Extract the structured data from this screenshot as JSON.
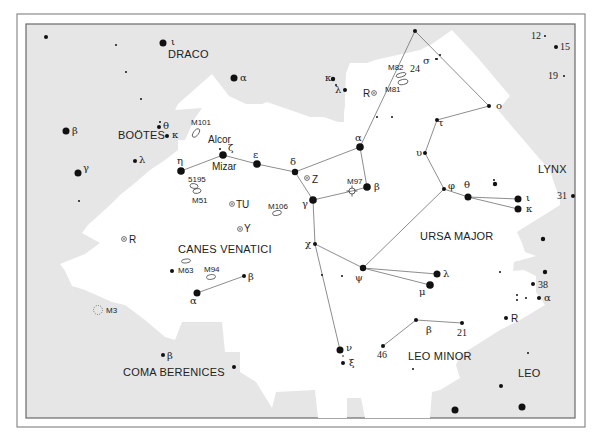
{
  "chart_data": {
    "type": "star-map",
    "title": "",
    "constellations": [
      {
        "name": "DRACO",
        "x": 168,
        "y": 58
      },
      {
        "name": "BOÖTES",
        "x": 118,
        "y": 139
      },
      {
        "name": "CANES VENATICI",
        "x": 178,
        "y": 253
      },
      {
        "name": "COMA BERENICES",
        "x": 123,
        "y": 376
      },
      {
        "name": "URSA MAJOR",
        "x": 420,
        "y": 240
      },
      {
        "name": "LEO MINOR",
        "x": 408,
        "y": 360
      },
      {
        "name": "LYNX",
        "x": 538,
        "y": 173
      },
      {
        "name": "LEO",
        "x": 518,
        "y": 377
      }
    ],
    "star_names": [
      {
        "name": "Alcor",
        "x": 208,
        "y": 143
      },
      {
        "name": "Mizar",
        "x": 212,
        "y": 170
      }
    ],
    "stars": [
      {
        "x": 46,
        "y": 37,
        "r": 2
      },
      {
        "x": 116,
        "y": 45,
        "r": 1
      },
      {
        "x": 163,
        "y": 43,
        "r": 3.5,
        "label": "ι",
        "lx": 171,
        "ly": 45
      },
      {
        "x": 126,
        "y": 72,
        "r": 1
      },
      {
        "x": 141,
        "y": 99,
        "r": 1
      },
      {
        "x": 234,
        "y": 78,
        "r": 3.5,
        "label": "α",
        "lx": 240,
        "ly": 81
      },
      {
        "x": 333,
        "y": 79,
        "r": 2.2,
        "label": "κ",
        "lx": 325,
        "ly": 81
      },
      {
        "x": 336,
        "y": 85,
        "r": 1
      },
      {
        "x": 345,
        "y": 90,
        "r": 2,
        "label": "λ",
        "lx": 335,
        "ly": 93
      },
      {
        "x": 66,
        "y": 131,
        "r": 3.5,
        "label": "β",
        "lx": 72,
        "ly": 134
      },
      {
        "x": 159,
        "y": 127,
        "r": 2,
        "label": "θ",
        "lx": 163,
        "ly": 129
      },
      {
        "x": 160,
        "y": 122,
        "r": 1
      },
      {
        "x": 167,
        "y": 136,
        "r": 2,
        "label": "κ",
        "lx": 172,
        "ly": 138
      },
      {
        "x": 78,
        "y": 173,
        "r": 3.5,
        "label": "γ",
        "lx": 83,
        "ly": 171
      },
      {
        "x": 135,
        "y": 161,
        "r": 2,
        "label": "λ",
        "lx": 139,
        "ly": 163
      },
      {
        "x": 79,
        "y": 201,
        "r": 1
      },
      {
        "x": 181,
        "y": 171,
        "r": 3.8,
        "label": "η",
        "lx": 177,
        "ly": 164
      },
      {
        "x": 223,
        "y": 155,
        "r": 3.8,
        "label": "ζ",
        "lx": 228,
        "ly": 151
      },
      {
        "x": 220,
        "y": 149,
        "r": 1
      },
      {
        "x": 257,
        "y": 164,
        "r": 3.8,
        "label": "ε",
        "lx": 253,
        "ly": 158
      },
      {
        "x": 295,
        "y": 172,
        "r": 3.2,
        "label": "δ",
        "lx": 290,
        "ly": 165
      },
      {
        "x": 313,
        "y": 200,
        "r": 3.8,
        "label": "γ",
        "lx": 302,
        "ly": 207
      },
      {
        "x": 360,
        "y": 147,
        "r": 3.8,
        "label": "α",
        "lx": 355,
        "ly": 141
      },
      {
        "x": 367,
        "y": 187,
        "r": 3.8,
        "label": "β",
        "lx": 374,
        "ly": 190
      },
      {
        "x": 315,
        "y": 244,
        "r": 2,
        "label": "χ",
        "lx": 305,
        "ly": 247
      },
      {
        "x": 363,
        "y": 268,
        "r": 3.2,
        "label": "ψ",
        "lx": 355,
        "ly": 281
      },
      {
        "x": 437,
        "y": 274,
        "r": 3.5,
        "label": "λ",
        "lx": 443,
        "ly": 277
      },
      {
        "x": 430,
        "y": 285,
        "r": 3.8,
        "label": "μ",
        "lx": 419,
        "ly": 295
      },
      {
        "x": 322,
        "y": 275,
        "r": 1
      },
      {
        "x": 342,
        "y": 276,
        "r": 1
      },
      {
        "x": 340,
        "y": 350,
        "r": 3.5,
        "label": "ν",
        "lx": 346,
        "ly": 351
      },
      {
        "x": 343,
        "y": 363,
        "r": 2,
        "label": "ξ",
        "lx": 349,
        "ly": 366
      },
      {
        "x": 343,
        "y": 356,
        "r": 0.8
      },
      {
        "x": 416,
        "y": 320,
        "r": 2,
        "label": "β",
        "lx": 426,
        "ly": 333
      },
      {
        "x": 462,
        "y": 323,
        "r": 2,
        "label": "21",
        "lx": 457,
        "ly": 336,
        "numeric": true
      },
      {
        "x": 383,
        "y": 346,
        "r": 2,
        "label": "46",
        "lx": 377,
        "ly": 358,
        "numeric": true
      },
      {
        "x": 413,
        "y": 369,
        "r": 1
      },
      {
        "x": 415,
        "y": 31,
        "r": 2,
        "label": "24",
        "lx": 410,
        "ly": 72,
        "numeric": true
      },
      {
        "x": 436,
        "y": 59,
        "r": 1,
        "label": "σ",
        "lx": 423,
        "ly": 64
      },
      {
        "x": 440,
        "y": 55,
        "r": 1
      },
      {
        "x": 437,
        "y": 59,
        "r": 1
      },
      {
        "x": 489,
        "y": 106,
        "r": 2,
        "label": "ο",
        "lx": 496,
        "ly": 109
      },
      {
        "x": 437,
        "y": 120,
        "r": 2,
        "label": "τ",
        "lx": 438,
        "ly": 126
      },
      {
        "x": 425,
        "y": 153,
        "r": 2,
        "label": "υ",
        "lx": 416,
        "ly": 156
      },
      {
        "x": 444,
        "y": 189,
        "r": 2,
        "label": "φ",
        "lx": 448,
        "ly": 189
      },
      {
        "x": 468,
        "y": 197,
        "r": 3.5,
        "label": "θ",
        "lx": 464,
        "ly": 188
      },
      {
        "x": 518,
        "y": 199,
        "r": 3.5,
        "label": "ι",
        "lx": 526,
        "ly": 201
      },
      {
        "x": 518,
        "y": 209,
        "r": 3.5,
        "label": "κ",
        "lx": 526,
        "ly": 212
      },
      {
        "x": 495,
        "y": 184,
        "r": 2.2
      },
      {
        "x": 494,
        "y": 180,
        "r": 1
      },
      {
        "x": 377,
        "y": 117,
        "r": 1
      },
      {
        "x": 392,
        "y": 117,
        "r": 1
      },
      {
        "x": 545,
        "y": 36,
        "r": 1,
        "label": "12",
        "lx": 531,
        "ly": 39,
        "numeric": true
      },
      {
        "x": 556,
        "y": 47,
        "r": 2,
        "label": "15",
        "lx": 560,
        "ly": 50,
        "numeric": true
      },
      {
        "x": 564,
        "y": 76,
        "r": 1,
        "label": "19",
        "lx": 548,
        "ly": 79,
        "numeric": true
      },
      {
        "x": 573,
        "y": 196,
        "r": 2,
        "label": "31",
        "lx": 557,
        "ly": 199,
        "numeric": true
      },
      {
        "x": 543,
        "y": 239,
        "r": 2.2
      },
      {
        "x": 500,
        "y": 272,
        "r": 1
      },
      {
        "x": 545,
        "y": 272,
        "r": 2.2
      },
      {
        "x": 533,
        "y": 284,
        "r": 2,
        "label": "38",
        "lx": 538,
        "ly": 288,
        "numeric": true
      },
      {
        "x": 517,
        "y": 295,
        "r": 1
      },
      {
        "x": 517,
        "y": 300,
        "r": 1
      },
      {
        "x": 526,
        "y": 298,
        "r": 1
      },
      {
        "x": 539,
        "y": 298,
        "r": 2,
        "label": "α",
        "lx": 544,
        "ly": 301
      },
      {
        "x": 506,
        "y": 318,
        "r": 2,
        "label": "R",
        "lx": 511,
        "ly": 322,
        "variable_plain": true
      },
      {
        "x": 528,
        "y": 353,
        "r": 1
      },
      {
        "x": 501,
        "y": 386,
        "r": 2
      },
      {
        "x": 455,
        "y": 410,
        "r": 3.5
      },
      {
        "x": 522,
        "y": 407,
        "r": 3.5
      },
      {
        "x": 163,
        "y": 355,
        "r": 2,
        "label": "β",
        "lx": 167,
        "ly": 359
      },
      {
        "x": 234,
        "y": 367,
        "r": 2
      },
      {
        "x": 197,
        "y": 293,
        "r": 3.5,
        "label": "α",
        "lx": 190,
        "ly": 304
      },
      {
        "x": 244,
        "y": 276,
        "r": 2,
        "label": "β",
        "lx": 248,
        "ly": 280
      },
      {
        "x": 172,
        "y": 271,
        "r": 2
      }
    ],
    "lines": [
      [
        [
          181,
          171
        ],
        [
          223,
          155
        ]
      ],
      [
        [
          223,
          155
        ],
        [
          257,
          164
        ]
      ],
      [
        [
          257,
          164
        ],
        [
          295,
          172
        ]
      ],
      [
        [
          295,
          172
        ],
        [
          360,
          147
        ]
      ],
      [
        [
          295,
          172
        ],
        [
          313,
          200
        ]
      ],
      [
        [
          360,
          147
        ],
        [
          367,
          187
        ]
      ],
      [
        [
          313,
          200
        ],
        [
          352,
          191
        ]
      ],
      [
        [
          352,
          191
        ],
        [
          367,
          187
        ]
      ],
      [
        [
          360,
          147
        ],
        [
          415,
          31
        ]
      ],
      [
        [
          415,
          31
        ],
        [
          489,
          106
        ]
      ],
      [
        [
          489,
          106
        ],
        [
          437,
          120
        ]
      ],
      [
        [
          437,
          120
        ],
        [
          425,
          153
        ]
      ],
      [
        [
          425,
          153
        ],
        [
          444,
          189
        ]
      ],
      [
        [
          444,
          189
        ],
        [
          468,
          197
        ]
      ],
      [
        [
          468,
          197
        ],
        [
          518,
          199
        ]
      ],
      [
        [
          468,
          197
        ],
        [
          518,
          209
        ]
      ],
      [
        [
          444,
          189
        ],
        [
          363,
          268
        ]
      ],
      [
        [
          363,
          268
        ],
        [
          437,
          274
        ]
      ],
      [
        [
          363,
          268
        ],
        [
          430,
          285
        ]
      ],
      [
        [
          313,
          200
        ],
        [
          315,
          244
        ]
      ],
      [
        [
          315,
          244
        ],
        [
          363,
          268
        ]
      ],
      [
        [
          315,
          244
        ],
        [
          340,
          350
        ]
      ],
      [
        [
          197,
          293
        ],
        [
          244,
          276
        ]
      ],
      [
        [
          383,
          346
        ],
        [
          416,
          320
        ]
      ],
      [
        [
          416,
          320
        ],
        [
          462,
          323
        ]
      ]
    ],
    "deep_sky": [
      {
        "id": "M101",
        "type": "galaxy",
        "x": 196,
        "y": 133,
        "rx": 5,
        "ry": 2.5,
        "rot": -55,
        "lx": 191,
        "ly": 125
      },
      {
        "id": "M82",
        "type": "galaxy",
        "x": 401,
        "y": 75,
        "rx": 5,
        "ry": 2,
        "rot": -15,
        "lx": 388,
        "ly": 70
      },
      {
        "id": "M81",
        "type": "galaxy",
        "x": 403,
        "y": 82,
        "rx": 5,
        "ry": 2.6,
        "rot": -10,
        "lx": 385,
        "ly": 92
      },
      {
        "id": "5195",
        "type": "galaxy",
        "x": 194,
        "y": 186,
        "rx": 4,
        "ry": 2.4,
        "rot": 10,
        "lx": 188,
        "ly": 182
      },
      {
        "id": "M51",
        "type": "galaxy",
        "x": 197,
        "y": 191,
        "rx": 4,
        "ry": 2.4,
        "rot": -10,
        "lx": 192,
        "ly": 203
      },
      {
        "id": "M106",
        "type": "galaxy",
        "x": 277,
        "y": 213,
        "rx": 4.5,
        "ry": 2.4,
        "rot": -10,
        "lx": 268,
        "ly": 209
      },
      {
        "id": "M63",
        "type": "galaxy",
        "x": 186,
        "y": 261,
        "rx": 4.5,
        "ry": 2,
        "rot": -5,
        "lx": 178,
        "ly": 273
      },
      {
        "id": "M94",
        "type": "galaxy",
        "x": 211,
        "y": 277,
        "rx": 4.5,
        "ry": 2.4,
        "rot": -5,
        "lx": 204,
        "ly": 272
      },
      {
        "id": "M97",
        "type": "planetary-nebula",
        "x": 352,
        "y": 191,
        "r": 3,
        "lx": 347,
        "ly": 184
      },
      {
        "id": "M3",
        "type": "globular-cluster",
        "x": 98,
        "y": 310,
        "r": 4.5,
        "lx": 106,
        "ly": 313
      }
    ],
    "variable_stars": [
      {
        "id": "R",
        "x": 374,
        "y": 93,
        "lx": 363,
        "ly": 97,
        "label_left": true
      },
      {
        "id": "Z",
        "x": 307,
        "y": 178,
        "lx": 312,
        "ly": 183
      },
      {
        "id": "TU",
        "x": 232,
        "y": 204,
        "lx": 236,
        "ly": 208
      },
      {
        "id": "Y",
        "x": 240,
        "y": 229,
        "lx": 244,
        "ly": 232
      },
      {
        "id": "R",
        "x": 124,
        "y": 239,
        "lx": 129,
        "ly": 243
      }
    ]
  },
  "colors": {
    "background_gray": "#e6e6e6",
    "region_white": "#ffffff",
    "star": "#111111",
    "line": "#707070",
    "frame": "#6a6a6a"
  }
}
